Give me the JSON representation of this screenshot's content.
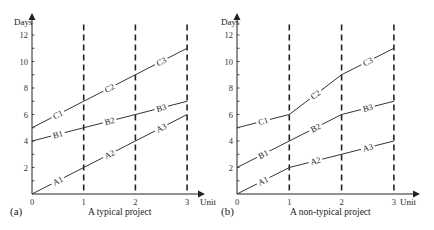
{
  "chart_data": [
    {
      "type": "line",
      "panel": "(a)",
      "title": "A typical project",
      "xlabel": "Unit",
      "ylabel": "Days",
      "x": [
        0,
        1,
        2,
        3
      ],
      "x_ticks": [
        "0",
        "1",
        "2",
        "3"
      ],
      "y_ticks": [
        "2",
        "4",
        "6",
        "8",
        "10",
        "12"
      ],
      "xlim": [
        0,
        3.3
      ],
      "ylim": [
        0,
        13
      ],
      "grid": "dashed vertical lines at x=1,2,3",
      "series": [
        {
          "name": "A",
          "values": [
            0,
            2,
            4,
            6
          ],
          "segment_labels": [
            "A1",
            "A2",
            "A3"
          ]
        },
        {
          "name": "B",
          "values": [
            4,
            5,
            6,
            7
          ],
          "segment_labels": [
            "B1",
            "B2",
            "B3"
          ]
        },
        {
          "name": "C",
          "values": [
            5,
            7,
            9,
            11
          ],
          "segment_labels": [
            "C1",
            "C2",
            "C3"
          ]
        }
      ]
    },
    {
      "type": "line",
      "panel": "(b)",
      "title": "A non-typical project",
      "xlabel": "Unit",
      "ylabel": "Days",
      "x": [
        0,
        1,
        2,
        3
      ],
      "x_ticks": [
        "0",
        "1",
        "2",
        "3"
      ],
      "y_ticks": [
        "2",
        "4",
        "6",
        "8",
        "10",
        "12"
      ],
      "xlim": [
        0,
        3.3
      ],
      "ylim": [
        0,
        13
      ],
      "grid": "dashed vertical lines at x=1,2,3",
      "series": [
        {
          "name": "A",
          "values": [
            0,
            2,
            3,
            4
          ],
          "segment_labels": [
            "A1",
            "A2",
            "A3"
          ]
        },
        {
          "name": "B",
          "values": [
            2,
            4,
            6,
            7
          ],
          "segment_labels": [
            "B1",
            "B2",
            "B3"
          ]
        },
        {
          "name": "C",
          "values": [
            5,
            6,
            9,
            11
          ],
          "segment_labels": [
            "C1",
            "C2",
            "C3"
          ]
        }
      ]
    }
  ],
  "panels": [
    {
      "tag": "(a)",
      "caption": "A typical project",
      "ylabel": "Days",
      "xlabel": "Unit"
    },
    {
      "tag": "(b)",
      "caption": "A non-typical project",
      "ylabel": "Days",
      "xlabel": "Unit"
    }
  ],
  "colors": {
    "line": "#333333",
    "axis": "#222222",
    "grid": "#222222"
  }
}
